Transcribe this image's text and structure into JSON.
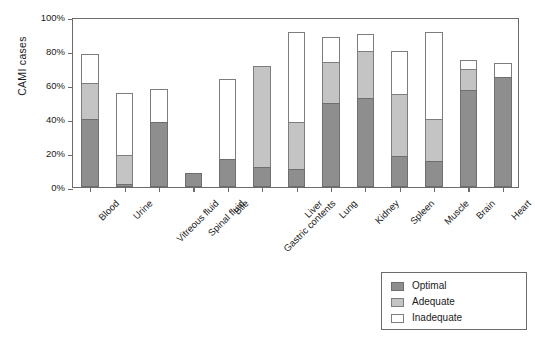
{
  "chart_data": {
    "type": "bar",
    "subtype": "stacked-bar",
    "title": "",
    "xlabel": "",
    "ylabel": "CAMI cases",
    "ylim": [
      0,
      100
    ],
    "yticks": [
      "0%",
      "20%",
      "40%",
      "60%",
      "80%",
      "100%"
    ],
    "ytick_values": [
      0,
      20,
      40,
      60,
      80,
      100
    ],
    "grid": false,
    "legend_position": "bottom-right",
    "categories": [
      "Blood",
      "Urine",
      "Vitreous fluid",
      "Spinal fluid",
      "Bile",
      "Gastric contents",
      "Liver",
      "Lung",
      "Kidney",
      "Spleen",
      "Muscle",
      "Brain",
      "Heart"
    ],
    "series": [
      {
        "name": "Optimal",
        "color": "#8e8e8e",
        "values": [
          40,
          2,
          38,
          8.5,
          16.5,
          11.5,
          10.5,
          49.5,
          52.5,
          18.5,
          15.5,
          57,
          65
        ]
      },
      {
        "name": "Adequate",
        "color": "#c4c4c4",
        "values": [
          21,
          17,
          0,
          0,
          0,
          59.5,
          27.5,
          24,
          27.5,
          36.5,
          24.5,
          12.5,
          0
        ]
      },
      {
        "name": "Inadequate",
        "color": "#ffffff",
        "values": [
          17.5,
          36.5,
          19.5,
          0,
          47,
          0,
          53,
          14.5,
          10,
          25,
          51,
          5,
          8
        ]
      }
    ],
    "totals": [
      78.5,
      55.5,
      57.5,
      8.5,
      63.5,
      71,
      91,
      88,
      90,
      80,
      91,
      74.5,
      73
    ]
  },
  "legend": {
    "items": [
      {
        "label": "Optimal",
        "swatch": "optimal"
      },
      {
        "label": "Adequate",
        "swatch": "adequate"
      },
      {
        "label": "Inadequate",
        "swatch": "inadequate"
      }
    ]
  }
}
